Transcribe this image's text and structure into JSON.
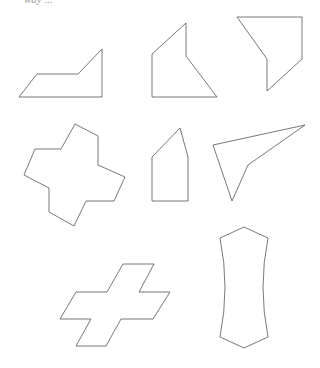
{
  "header": {
    "cut_text": "way ..."
  },
  "figure": {
    "stroke_color": "#555555",
    "background": "#ffffff",
    "shapes": [
      {
        "name": "irregular-pentagon-trapezoid",
        "points": "19,97 37,74 78,74 102,49 102,97"
      },
      {
        "name": "irregular-pentagon-house",
        "points": "152,97 152,54 186,23 186,56 217,97"
      },
      {
        "name": "irregular-pentagon-shield",
        "points": "237,17 302,17 302,59 267,91 267,59"
      },
      {
        "name": "rotated-cross",
        "points": "75,124 98,136 98,165 125,177 114,201 86,201 74,226 49,212 49,188 24,175 35,149 61,149"
      },
      {
        "name": "pentagon-pencil",
        "points": "152,201 152,157 180,128 188,157 188,201"
      },
      {
        "name": "concave-arrowhead",
        "points": "213,145 305,125 248,165 232,201"
      },
      {
        "name": "skewed-cross",
        "points": "123,264 154,264 139,292 170,292 153,319 121,319 106,346 76,346 91,319 60,319 76,292 107,292"
      },
      {
        "name": "concave-bone",
        "path": "M244,227 L268,238 Q258,287 268,337 L244,348 L220,337 Q230,287 220,238 Z"
      }
    ]
  }
}
